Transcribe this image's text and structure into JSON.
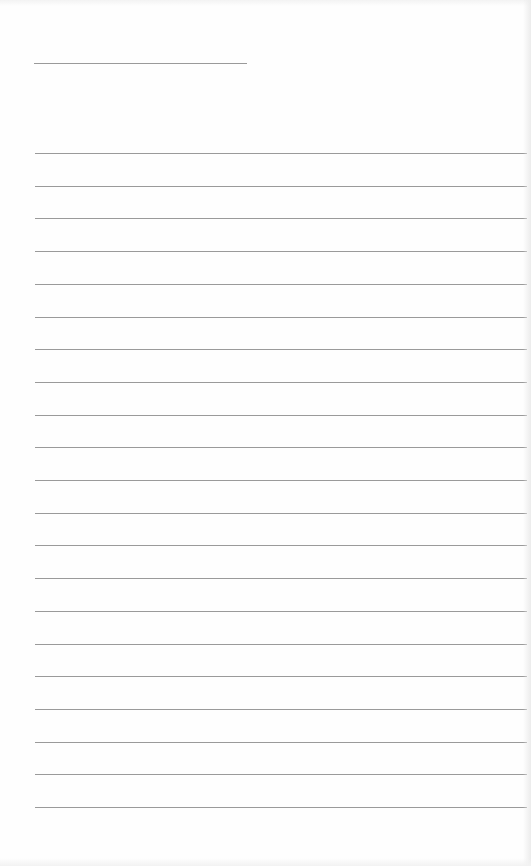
{
  "sheet": {
    "type": "lined-paper",
    "background": "#fefefe",
    "line_color": "#9a9a9a",
    "header_line": {
      "x": 34,
      "y": 63,
      "width": 213
    },
    "ruled_lines": {
      "count": 21,
      "first_y": 153,
      "spacing": 32.7,
      "x_start": 35,
      "x_end": 527
    }
  }
}
